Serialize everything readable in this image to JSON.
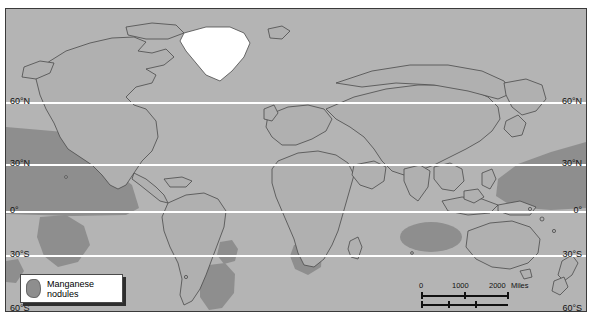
{
  "map": {
    "title": "World map of manganese nodule distribution",
    "projection_note": "",
    "colors": {
      "ocean": "#b4b4b4",
      "land": "#b0b0b0",
      "nodules": "#8e8e8e",
      "ice": "#ffffff",
      "graticule": "#ffffff",
      "coastline": "#4a4a4a",
      "frame": "#3a3a3a",
      "page_background": "#ffffff"
    },
    "latitude_labels_left": [
      {
        "label": "60°N",
        "y": 88
      },
      {
        "label": "30°N",
        "y": 150
      },
      {
        "label": "0°",
        "y": 197
      },
      {
        "label": "30°S",
        "y": 241
      },
      {
        "label": "60°S",
        "y": 303
      }
    ],
    "latitude_labels_right": [
      {
        "label": "60°N",
        "y": 88
      },
      {
        "label": "30°N",
        "y": 150
      },
      {
        "label": "0°",
        "y": 197
      },
      {
        "label": "30°S",
        "y": 241
      },
      {
        "label": "60°S",
        "y": 303
      }
    ],
    "gridlines_y": [
      93,
      155,
      202,
      246,
      308
    ]
  },
  "legend": {
    "label_line1": "Manganese",
    "label_line2": "nodules",
    "swatch_name": "manganese-nodule-swatch"
  },
  "scalebar": {
    "miles": {
      "unit": "Miles",
      "ticks": [
        "0",
        "1000",
        "2000"
      ]
    },
    "kilometers": {
      "unit": "Kilometers",
      "ticks": [
        "0",
        "1000",
        "2000"
      ]
    }
  }
}
